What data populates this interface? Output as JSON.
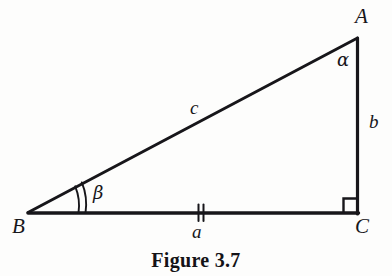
{
  "figure": {
    "caption": "Figure 3.7",
    "type": "right-triangle-geometry-diagram",
    "ink_color": "#17161a",
    "background_color": "#fdfdfc",
    "vertices": [
      {
        "name": "A",
        "label": "A",
        "x": 357,
        "y": 38,
        "role": "top-right-apex"
      },
      {
        "name": "B",
        "label": "B",
        "x": 28,
        "y": 213,
        "role": "bottom-left"
      },
      {
        "name": "C",
        "label": "C",
        "x": 358,
        "y": 213,
        "role": "bottom-right-right-angle"
      }
    ],
    "sides": [
      {
        "name": "a",
        "label": "a",
        "from": "B",
        "to": "C",
        "description": "base / adjacent side",
        "tick_marks": 2
      },
      {
        "name": "b",
        "label": "b",
        "from": "C",
        "to": "A",
        "description": "vertical right side",
        "tick_marks": 0
      },
      {
        "name": "c",
        "label": "c",
        "from": "B",
        "to": "A",
        "description": "hypotenuse",
        "tick_marks": 0
      }
    ],
    "angles": [
      {
        "name": "alpha",
        "label": "α",
        "at_vertex": "A",
        "marker": "none"
      },
      {
        "name": "beta",
        "label": "β",
        "at_vertex": "B",
        "marker": "double-arc"
      },
      {
        "name": "gamma",
        "label": "",
        "at_vertex": "C",
        "marker": "right-angle-square",
        "value": "90"
      }
    ]
  }
}
